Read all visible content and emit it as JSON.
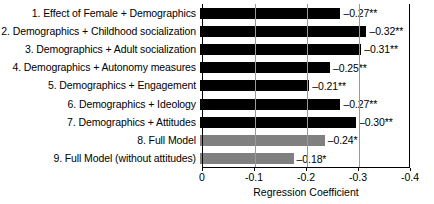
{
  "chart_data": {
    "type": "bar",
    "orientation": "horizontal",
    "title": "",
    "xlabel": "Regression Coefficient",
    "ylabel": "",
    "xlim": [
      0,
      -0.4
    ],
    "xticks": [
      "0",
      "-0.1",
      "-0.2",
      "-0.3",
      "-0.4"
    ],
    "xtick_values": [
      0,
      -0.1,
      -0.2,
      -0.3,
      -0.4
    ],
    "grid": "vertical gridlines at -0.1, -0.2, -0.3",
    "legend": "none",
    "categories": [
      "1. Effect of Female + Demographics",
      "2. Demographics + Childhood socialization",
      "3. Demographics + Adult socialization",
      "4. Demographics + Autonomy measures",
      "5. Demographics + Engagement",
      "6. Demographics + Ideology",
      "7. Demographics + Attitudes",
      "8. Full Model",
      "9. Full Model (without attitudes)"
    ],
    "values": [
      -0.27,
      -0.32,
      -0.31,
      -0.25,
      -0.21,
      -0.27,
      -0.3,
      -0.24,
      -0.18
    ],
    "value_labels": [
      "–0.27**",
      "–0.32**",
      "–0.31**",
      "–0.25**",
      "–0.21**",
      "–0.27**",
      "–0.30**",
      "–0.24*",
      "–0.18*"
    ],
    "bar_colors": [
      "#000000",
      "#000000",
      "#000000",
      "#000000",
      "#000000",
      "#000000",
      "#000000",
      "#808080",
      "#808080"
    ],
    "colors": {
      "black_bar": "#000000",
      "gray_bar": "#808080",
      "gridline": "#9a9a9a",
      "axis": "#000000",
      "background": "#ffffff"
    }
  }
}
